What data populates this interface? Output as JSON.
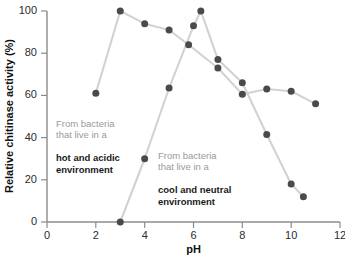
{
  "chart_data": {
    "type": "scatter",
    "title": "",
    "xlabel": "pH",
    "ylabel": "Relative chitinase activity (%)",
    "xlim": [
      0,
      12
    ],
    "ylim": [
      0,
      100
    ],
    "xticks": [
      0,
      2,
      4,
      6,
      8,
      10,
      12
    ],
    "yticks": [
      0,
      20,
      40,
      60,
      80,
      100
    ],
    "grid": false,
    "legend_position": "none",
    "marker_color": "#4a4a4a",
    "line_color": "#d2d2d2",
    "series": [
      {
        "name": "From bacteria that live in a hot and acidic environment",
        "x": [
          2,
          3,
          4,
          5,
          5.8,
          7,
          8,
          9,
          10,
          11
        ],
        "values": [
          61,
          100,
          94,
          91,
          84,
          73,
          60.5,
          63,
          62,
          56
        ]
      },
      {
        "name": "From bacteria that live in a cool and neutral environment",
        "x": [
          3,
          4,
          5,
          6,
          6.3,
          7,
          8,
          9,
          10,
          10.5
        ],
        "values": [
          0,
          30,
          63.5,
          93,
          100,
          77,
          66,
          41.5,
          18,
          12
        ]
      }
    ],
    "annotations": [
      {
        "id": "hot",
        "lead": "From bacteria\nthat live in a",
        "strong": "hot and acidic\nenvironment"
      },
      {
        "id": "cool",
        "lead": "From bacteria\nthat live in a",
        "strong": "cool and neutral\nenvironment"
      }
    ]
  }
}
